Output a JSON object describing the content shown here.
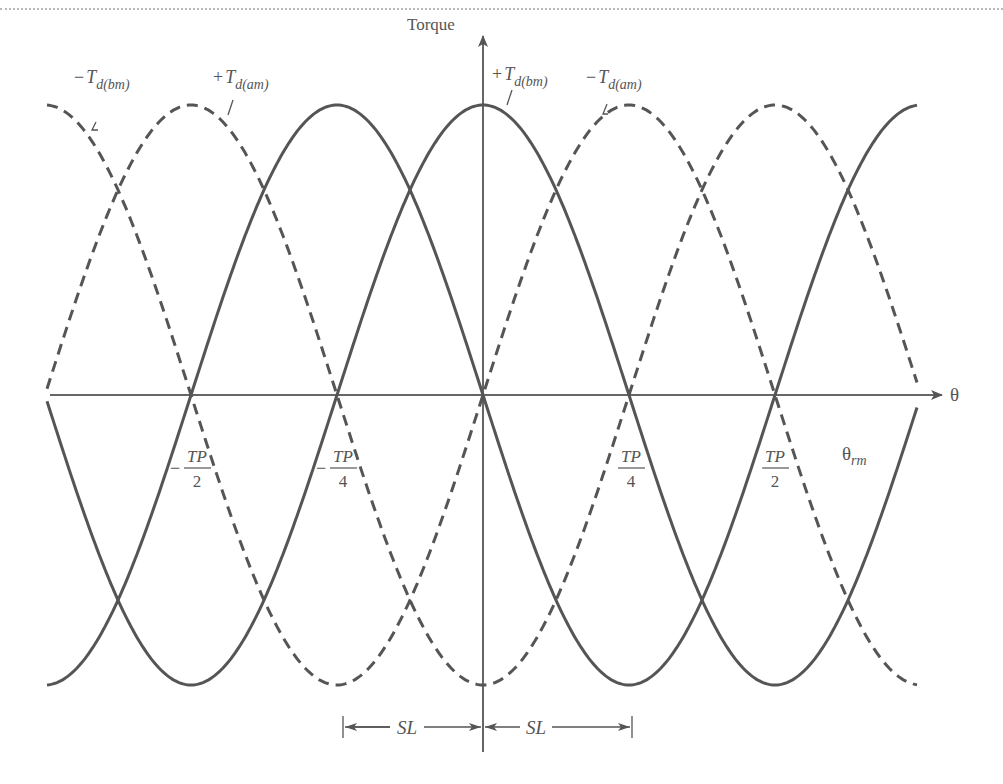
{
  "diagram": {
    "axes": {
      "y_label": "Torque",
      "x_label": "θ",
      "x_sublabel": {
        "base": "θ",
        "sub": "rm"
      }
    },
    "curve_labels": [
      {
        "id": "neg-tdbm",
        "sign": "−",
        "T": "T",
        "sub": "d(bm)",
        "style": "dashed"
      },
      {
        "id": "pos-tdam",
        "sign": "+",
        "T": "T",
        "sub": "d(am)",
        "style": "solid"
      },
      {
        "id": "pos-tdbm",
        "sign": "+",
        "T": "T",
        "sub": "d(bm)",
        "style": "solid"
      },
      {
        "id": "neg-tdam",
        "sign": "−",
        "T": "T",
        "sub": "d(am)",
        "style": "dashed"
      }
    ],
    "tick_labels": [
      {
        "sign": "−",
        "num": "TP",
        "den": "2"
      },
      {
        "sign": "−",
        "num": "TP",
        "den": "4"
      },
      {
        "sign": "",
        "num": "TP",
        "den": "4"
      },
      {
        "sign": "",
        "num": "TP",
        "den": "2"
      }
    ],
    "dimensions": [
      {
        "label": "SL"
      },
      {
        "label": "SL"
      }
    ],
    "colors": {
      "stroke": "#555555",
      "background": "#ffffff"
    }
  }
}
